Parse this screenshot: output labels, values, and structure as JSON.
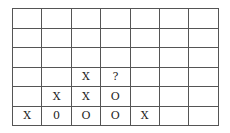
{
  "board": {
    "columns": 7,
    "rows": [
      [
        "",
        "",
        "",
        "",
        "",
        "",
        ""
      ],
      [
        "",
        "",
        "",
        "",
        "",
        "",
        ""
      ],
      [
        "",
        "",
        "",
        "",
        "",
        "",
        ""
      ],
      [
        "",
        "",
        "X",
        "?",
        "",
        "",
        ""
      ],
      [
        "",
        "X",
        "X",
        "O",
        "",
        "",
        ""
      ],
      [
        "X",
        "0",
        "O",
        "O",
        "X",
        "",
        ""
      ]
    ]
  }
}
